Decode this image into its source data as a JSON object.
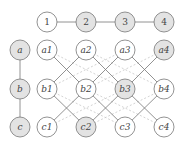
{
  "colors": {
    "stroke": "#777777",
    "filled": "#e3e3e3",
    "empty": "#ffffff",
    "dashed": "#c8c8c8"
  },
  "top_row": [
    {
      "id": "1",
      "label": "1",
      "x": 47,
      "y": 22,
      "filled": false
    },
    {
      "id": "2",
      "label": "2",
      "x": 86,
      "y": 22,
      "filled": true
    },
    {
      "id": "3",
      "label": "3",
      "x": 125,
      "y": 22,
      "filled": true
    },
    {
      "id": "4",
      "label": "4",
      "x": 164,
      "y": 22,
      "filled": true
    }
  ],
  "left_col": [
    {
      "id": "a",
      "label": "a",
      "x": 20,
      "y": 50,
      "filled": true
    },
    {
      "id": "b",
      "label": "b",
      "x": 20,
      "y": 89,
      "filled": true
    },
    {
      "id": "c",
      "label": "c",
      "x": 20,
      "y": 127,
      "filled": true
    }
  ],
  "grid": [
    {
      "id": "a1",
      "label": "a1",
      "x": 47,
      "y": 50,
      "filled": false
    },
    {
      "id": "a2",
      "label": "a2",
      "x": 86,
      "y": 50,
      "filled": false
    },
    {
      "id": "a3",
      "label": "a3",
      "x": 125,
      "y": 50,
      "filled": false
    },
    {
      "id": "a4",
      "label": "a4",
      "x": 164,
      "y": 50,
      "filled": true
    },
    {
      "id": "b1",
      "label": "b1",
      "x": 47,
      "y": 89,
      "filled": false
    },
    {
      "id": "b2",
      "label": "b2",
      "x": 86,
      "y": 89,
      "filled": false
    },
    {
      "id": "b3",
      "label": "b3",
      "x": 125,
      "y": 89,
      "filled": true
    },
    {
      "id": "b4",
      "label": "b4",
      "x": 164,
      "y": 89,
      "filled": false
    },
    {
      "id": "c1",
      "label": "c1",
      "x": 47,
      "y": 127,
      "filled": false
    },
    {
      "id": "c2",
      "label": "c2",
      "x": 86,
      "y": 127,
      "filled": true
    },
    {
      "id": "c3",
      "label": "c3",
      "x": 125,
      "y": 127,
      "filled": false
    },
    {
      "id": "c4",
      "label": "c4",
      "x": 164,
      "y": 127,
      "filled": false
    }
  ],
  "solid_edges": [
    [
      "1",
      "2"
    ],
    [
      "2",
      "3"
    ],
    [
      "3",
      "4"
    ],
    [
      "a",
      "b"
    ],
    [
      "b",
      "c"
    ],
    [
      "a1",
      "b2"
    ],
    [
      "a2",
      "b1"
    ],
    [
      "a2",
      "b3"
    ],
    [
      "a3",
      "b2"
    ],
    [
      "a3",
      "b4"
    ],
    [
      "a4",
      "b3"
    ],
    [
      "b1",
      "c2"
    ],
    [
      "b2",
      "c1"
    ],
    [
      "b2",
      "c3"
    ],
    [
      "b3",
      "c2"
    ],
    [
      "b3",
      "c4"
    ],
    [
      "b4",
      "c3"
    ]
  ],
  "dashed_edges": [
    [
      "a1",
      "b3"
    ],
    [
      "a2",
      "b4"
    ],
    [
      "a3",
      "b1"
    ],
    [
      "a4",
      "b2"
    ],
    [
      "b1",
      "c3"
    ],
    [
      "b2",
      "c4"
    ],
    [
      "b3",
      "c1"
    ],
    [
      "b4",
      "c2"
    ]
  ]
}
